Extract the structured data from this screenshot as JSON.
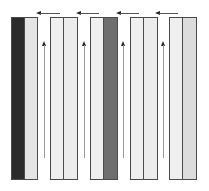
{
  "diagram": {
    "colors": {
      "outline": "#4a4a4a",
      "dark": "#2b2b2b",
      "medium": "#6f6f6f",
      "light": "#e6e6e6",
      "lighter": "#efefef",
      "light_gray": "#dcdcdc",
      "arrow_shaft": "#9a9a9a",
      "arrow_head": "#222222"
    },
    "pairs": [
      {
        "id": 1,
        "x": 11,
        "left_fill": "#2b2b2b",
        "right_fill": "#e4e4e4"
      },
      {
        "id": 2,
        "x": 50,
        "left_fill": "#efefef",
        "right_fill": "#ececec"
      },
      {
        "id": 3,
        "x": 90,
        "left_fill": "#efefef",
        "right_fill": "#6f6f6f"
      },
      {
        "id": 4,
        "x": 130,
        "left_fill": "#efefef",
        "right_fill": "#ececec"
      },
      {
        "id": 5,
        "x": 169,
        "left_fill": "#efefef",
        "right_fill": "#dcdcdc"
      }
    ],
    "up_arrows": [
      {
        "between": "1-2",
        "x": 44,
        "direction": "up"
      },
      {
        "between": "2-3",
        "x": 84,
        "direction": "up"
      },
      {
        "between": "3-4",
        "x": 123,
        "direction": "up"
      },
      {
        "between": "4-5",
        "x": 163,
        "direction": "up"
      }
    ],
    "left_arrows": [
      {
        "x_from": 60,
        "x_to": 36,
        "direction": "left"
      },
      {
        "x_from": 99,
        "x_to": 76,
        "direction": "left"
      },
      {
        "x_from": 139,
        "x_to": 116,
        "direction": "left"
      },
      {
        "x_from": 178,
        "x_to": 155,
        "direction": "left"
      }
    ]
  }
}
